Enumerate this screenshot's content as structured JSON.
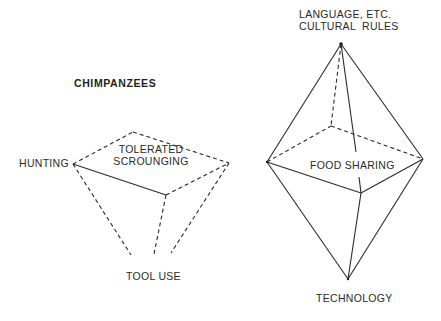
{
  "left_diagram": {
    "title": "CHIMPANZEES",
    "labels": {
      "hunting": "HUNTING",
      "tolerated_line1": "TOLERATED",
      "tolerated_line2": "SCROUNGING",
      "tool_use": "TOOL USE"
    }
  },
  "right_diagram": {
    "labels": {
      "language_line1": "LANGUAGE, ETC.",
      "language_line2": "CULTURAL  RULES",
      "food_sharing": "FOOD SHARING",
      "technology": "TECHNOLOGY"
    }
  },
  "colors": {
    "line": "#2a2a2a",
    "text": "#2a2a2a",
    "background": "#ffffff"
  }
}
